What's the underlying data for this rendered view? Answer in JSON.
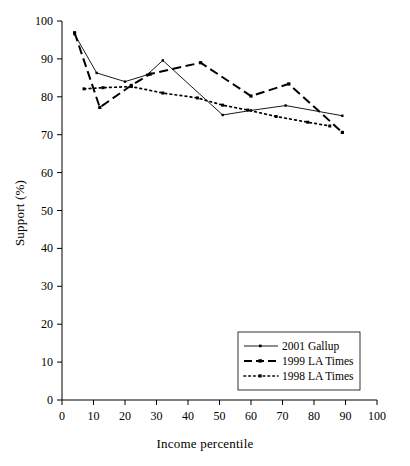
{
  "chart_data": {
    "type": "line",
    "title": "",
    "xlabel": "Income percentile",
    "ylabel": "Support (%)",
    "xlim": [
      0,
      100
    ],
    "ylim": [
      0,
      100
    ],
    "xticks": [
      0,
      10,
      20,
      30,
      40,
      50,
      60,
      70,
      80,
      90,
      100
    ],
    "yticks": [
      0,
      10,
      20,
      30,
      40,
      50,
      60,
      70,
      80,
      90,
      100
    ],
    "grid": false,
    "legend_position": "lower-right",
    "series": [
      {
        "name": "2001 Gallup",
        "style": "solid-thin-with-small-markers",
        "color": "#000000",
        "points": [
          {
            "x": 4,
            "y": 96.5
          },
          {
            "x": 11,
            "y": 86.3
          },
          {
            "x": 20,
            "y": 84.0
          },
          {
            "x": 27,
            "y": 85.8
          },
          {
            "x": 32,
            "y": 89.6
          },
          {
            "x": 51,
            "y": 75.2
          },
          {
            "x": 60,
            "y": 76.4
          },
          {
            "x": 71,
            "y": 77.7
          },
          {
            "x": 89,
            "y": 75.0
          }
        ]
      },
      {
        "name": "1999 LA Times",
        "style": "long-dashed-thick",
        "color": "#000000",
        "points": [
          {
            "x": 4,
            "y": 96.9
          },
          {
            "x": 12,
            "y": 77.2
          },
          {
            "x": 22,
            "y": 83.0
          },
          {
            "x": 28,
            "y": 86.0
          },
          {
            "x": 44,
            "y": 89.0
          },
          {
            "x": 60,
            "y": 80.2
          },
          {
            "x": 72,
            "y": 83.4
          },
          {
            "x": 89,
            "y": 70.6
          }
        ]
      },
      {
        "name": "1998 LA Times",
        "style": "dotted",
        "color": "#000000",
        "points": [
          {
            "x": 7,
            "y": 82.1
          },
          {
            "x": 13,
            "y": 82.4
          },
          {
            "x": 22,
            "y": 82.7
          },
          {
            "x": 32,
            "y": 81.0
          },
          {
            "x": 43,
            "y": 79.7
          },
          {
            "x": 51,
            "y": 77.8
          },
          {
            "x": 59,
            "y": 76.5
          },
          {
            "x": 68,
            "y": 74.8
          },
          {
            "x": 78,
            "y": 73.3
          },
          {
            "x": 85,
            "y": 72.3
          }
        ]
      }
    ]
  },
  "axes": {
    "x": {
      "label": "Income percentile",
      "ticks": [
        "0",
        "10",
        "20",
        "30",
        "40",
        "50",
        "60",
        "70",
        "80",
        "90",
        "100"
      ]
    },
    "y": {
      "label": "Support (%)",
      "ticks": [
        "0",
        "10",
        "20",
        "30",
        "40",
        "50",
        "60",
        "70",
        "80",
        "90",
        "100"
      ]
    }
  },
  "legend": {
    "entries": [
      {
        "label": "2001 Gallup"
      },
      {
        "label": "1999 LA Times"
      },
      {
        "label": "1998 LA Times"
      }
    ]
  }
}
